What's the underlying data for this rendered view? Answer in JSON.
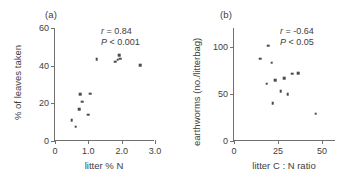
{
  "figure": {
    "width": 357,
    "height": 190,
    "background": "#ffffff",
    "marker_color": "#4a4a4a",
    "axis_color": "#707070",
    "text_color": "#3d3d3d"
  },
  "chart_data": [
    {
      "type": "scatter",
      "panel_label": "(a)",
      "title": "",
      "xlabel": "litter % N",
      "ylabel": "% of leaves taken",
      "xlim": [
        0,
        3.0
      ],
      "ylim": [
        0,
        60
      ],
      "xticks": [
        0,
        1.0,
        2.0,
        3.0
      ],
      "xtick_labels": [
        "0",
        "1.0",
        "2.0",
        "3.0"
      ],
      "yticks": [
        0,
        20,
        40,
        60
      ],
      "ytick_labels": [
        "0",
        "20",
        "40",
        "60"
      ],
      "grid": false,
      "legend": false,
      "annotations": [
        {
          "text_r": "r",
          "text_r_value": " = 0.84",
          "text_p": "P",
          "text_p_value": " < 0.001"
        }
      ],
      "stats": {
        "r": 0.84,
        "p": "< 0.001"
      },
      "x": [
        0.5,
        0.62,
        0.72,
        0.76,
        0.82,
        0.85,
        1.0,
        1.05,
        1.25,
        1.8,
        1.86,
        1.92,
        1.95,
        2.55
      ],
      "y": [
        11.0,
        7.5,
        16.8,
        25.0,
        20.8,
        21.0,
        14.0,
        25.2,
        43.5,
        42.0,
        43.2,
        45.5,
        43.6,
        40.2
      ],
      "points": [
        {
          "x": 0.5,
          "y": 11.0
        },
        {
          "x": 0.62,
          "y": 7.5
        },
        {
          "x": 0.72,
          "y": 16.8
        },
        {
          "x": 0.76,
          "y": 25.0
        },
        {
          "x": 0.82,
          "y": 20.8
        },
        {
          "x": 1.0,
          "y": 14.0
        },
        {
          "x": 1.05,
          "y": 25.2
        },
        {
          "x": 1.25,
          "y": 43.5
        },
        {
          "x": 1.8,
          "y": 42.0
        },
        {
          "x": 1.88,
          "y": 43.2
        },
        {
          "x": 1.92,
          "y": 45.5
        },
        {
          "x": 1.96,
          "y": 43.6
        },
        {
          "x": 2.55,
          "y": 40.2
        }
      ]
    },
    {
      "type": "scatter",
      "panel_label": "(b)",
      "title": "",
      "xlabel": "litter C : N ratio",
      "ylabel": "earthworms (no./litterbag)",
      "xlim": [
        0,
        58
      ],
      "ylim": [
        0,
        120
      ],
      "xticks": [
        0,
        25,
        50
      ],
      "xtick_labels": [
        "0",
        "25",
        "50"
      ],
      "yticks": [
        0,
        50,
        100
      ],
      "ytick_labels": [
        "0",
        "50",
        "100"
      ],
      "grid": false,
      "legend": false,
      "annotations": [
        {
          "text_r": "r",
          "text_r_value": " = -0.64",
          "text_p": "P",
          "text_p_value": " < 0.05"
        }
      ],
      "stats": {
        "r": -0.64,
        "p": "< 0.05"
      },
      "x": [
        15.0,
        18.5,
        19.5,
        21.5,
        22.0,
        23.5,
        26.5,
        28.5,
        30.5,
        33.0,
        36.5,
        46.5
      ],
      "y": [
        87.5,
        61.0,
        101.0,
        83.0,
        40.0,
        64.5,
        53.0,
        66.5,
        49.5,
        71.5,
        72.0,
        29.0
      ],
      "points": [
        {
          "x": 15.0,
          "y": 87.5
        },
        {
          "x": 18.5,
          "y": 61.0
        },
        {
          "x": 19.5,
          "y": 101.0
        },
        {
          "x": 21.5,
          "y": 83.0
        },
        {
          "x": 22.0,
          "y": 40.0
        },
        {
          "x": 23.5,
          "y": 64.5
        },
        {
          "x": 26.5,
          "y": 53.0
        },
        {
          "x": 28.5,
          "y": 66.5
        },
        {
          "x": 30.5,
          "y": 49.5
        },
        {
          "x": 33.0,
          "y": 71.5
        },
        {
          "x": 36.5,
          "y": 72.0
        },
        {
          "x": 46.5,
          "y": 29.0
        }
      ]
    }
  ]
}
